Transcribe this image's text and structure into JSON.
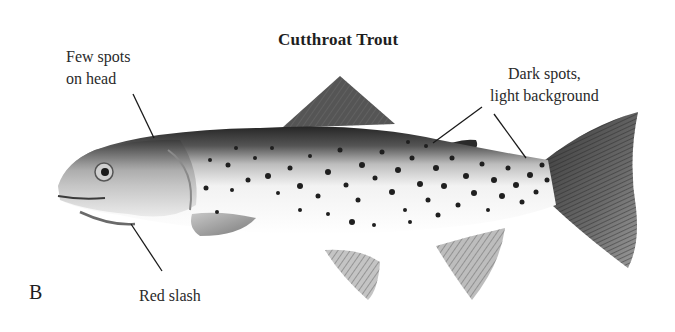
{
  "figure": {
    "title": "Cutthroat Trout",
    "panel_letter": "B"
  },
  "annotations": [
    {
      "id": "few-spots",
      "lines": [
        "Few spots",
        "on head"
      ],
      "points_to": "head"
    },
    {
      "id": "dark-spots",
      "lines": [
        "Dark spots,",
        "light background"
      ],
      "points_to": "back and tail"
    },
    {
      "id": "red-slash",
      "lines": [
        "Red slash"
      ],
      "points_to": "lower jaw"
    }
  ],
  "colors": {
    "background": "#ffffff",
    "text": "#222222",
    "fish_dark": "#2b2b2b",
    "fish_mid": "#8a8a8a",
    "fish_light": "#e6e6e6",
    "spot": "#1f1f1f",
    "leader_line": "#1a1a1a"
  }
}
